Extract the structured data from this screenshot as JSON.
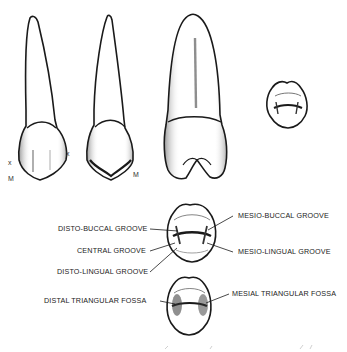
{
  "figure": {
    "views": [
      {
        "id": "labial-view",
        "marks": [
          "x",
          "x",
          "M"
        ]
      },
      {
        "id": "lingual-view",
        "marks": [
          "M"
        ]
      },
      {
        "id": "proximal-view",
        "marks": []
      },
      {
        "id": "incisal-occlusal-view",
        "marks": []
      }
    ],
    "labels": {
      "disto_buccal_groove": "DISTO-BUCCAL GROOVE",
      "central_groove": "CENTRAL GROOVE",
      "disto_lingual_groove": "DISTO-LINGUAL GROOVE",
      "mesio_buccal_groove": "MESIO-BUCCAL GROOVE",
      "mesio_lingual_groove": "MESIO-LINGUAL GROOVE",
      "distal_triangular_fossa": "DISTAL TRIANGULAR FOSSA",
      "mesial_triangular_fossa": "MESIAL TRIANGULAR FOSSA"
    },
    "marks": {
      "x_left": "x",
      "x_right": "x",
      "m_first": "M",
      "m_second": "M"
    },
    "colors": {
      "ink": "#1a1a1a",
      "background": "#ffffff",
      "stipple": "#555555"
    }
  }
}
